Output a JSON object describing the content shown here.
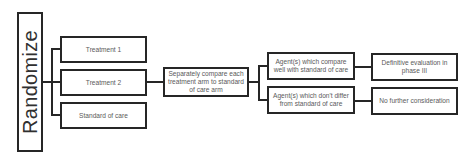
{
  "diagram": {
    "type": "flowchart",
    "root": {
      "label": "Randomize"
    },
    "arms": [
      {
        "label": "Treatment 1"
      },
      {
        "label": "Treatment 2"
      },
      {
        "label": "Standard of care"
      }
    ],
    "comparison": {
      "label": "Separately compare each treatment arm to standard of care arm"
    },
    "outcomes": [
      {
        "label": "Agent(s) which compare well with standard of care",
        "next": "Definitive evaluation in phase III"
      },
      {
        "label": "Agent(s) which don't differ from standard of care",
        "next": "No further consideration"
      }
    ],
    "colors": {
      "line": "#262626",
      "text": "#5a5a5a",
      "background": "#ffffff"
    }
  }
}
